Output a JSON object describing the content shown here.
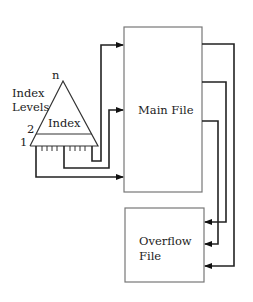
{
  "diagram": {
    "type": "indexed-sequential-file-organization",
    "index": {
      "label": "Index",
      "side_label_line1": "Index",
      "side_label_line2": "Levels",
      "level_top": "n",
      "level_2": "2",
      "level_1": "1"
    },
    "main_file": {
      "label": "Main File"
    },
    "overflow_file": {
      "label_line1": "Overflow",
      "label_line2": "File"
    },
    "connections": [
      {
        "from": "index-level-1",
        "to": "main-file",
        "note": "three pointers from index bottom level into main file"
      },
      {
        "from": "main-file",
        "to": "overflow-file",
        "note": "three overflow pointers from main file to overflow file"
      }
    ]
  }
}
